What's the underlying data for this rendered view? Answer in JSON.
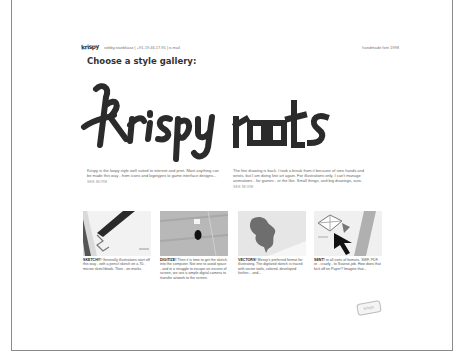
{
  "header": {
    "logo_text": "krispy",
    "contact": "sebby.stanbkasz  |  +91.19.46.17.95  |  e-mail",
    "tagline": "handmade font 1998"
  },
  "heading": "Choose a style gallery:",
  "galleries": [
    {
      "title": "Krispy",
      "description": "Krispy is the loopy style well suited to internet and print. Most anything can be made this way - from icons and logotypes to game interface designs...",
      "more_label": "SEE MORE"
    },
    {
      "title": "roots",
      "description": "The line drawing is back. I took a break from it because of sore hands and wrists, but I am doing line art again. For illustrations only. I can't manage animations - for games - or the like. Small things, and big drawings, sure.",
      "more_label": "SEE MORE"
    }
  ],
  "tiles": [
    {
      "label": "SKETCHY!",
      "text": "Generally illustrations start off this way - with a pencil sketch on a 70-micron sketchbook. Then - on marks."
    },
    {
      "label": "DIGITIZE!",
      "text": "Then it is time to get the sketch into the computer. Not one to avoid space - and in a struggle to escape an excess of screen, we use a simple digital camera to transfer artwork to the screen."
    },
    {
      "label": "VECTORS!",
      "text": "Messy's preferred format for illustrating. The digitized sketch is traced with vector tools, colored, developed further... and..."
    },
    {
      "label": "SENT!",
      "text": "to all sorts of formats. SWF, PDF, or - crazily - to Svanse-job. How does that kick off on Paper? Imagine that..."
    }
  ],
  "footer": {
    "stamp_label": "krispy"
  },
  "colors": {
    "frame_border": "#8a8a8a",
    "text_dark": "#333333",
    "text_muted": "#777777",
    "tile_bg": "#e8e8e8"
  }
}
